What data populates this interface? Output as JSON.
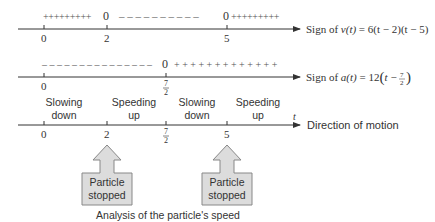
{
  "rows": [
    {
      "signs_left": "+++++++++",
      "zero_a": "0",
      "signs_mid": "– – – – – – – – – –",
      "zero_b": "0",
      "signs_right": "+++++++++",
      "ticks": [
        "0",
        "2",
        "5"
      ],
      "label_prefix": "Sign of ",
      "label_func": "v(t)",
      "label_expr": " = 6(t − 2)(t − 5)"
    },
    {
      "signs_left": "– – – – – – – – – – – – – – –",
      "zero": "0",
      "signs_right": "+ + + + + + + + + + + + +",
      "ticks": [
        "0"
      ],
      "frac_num": "7",
      "frac_den": "2",
      "label_prefix": "Sign of ",
      "label_func": "a(t)",
      "label_expr_a": " = 12",
      "label_expr_b": "t − ",
      "label_frac_num": "7",
      "label_frac_den": "2"
    },
    {
      "intervals": [
        {
          "line1": "Slowing",
          "line2": "down"
        },
        {
          "line1": "Speeding",
          "line2": "up"
        },
        {
          "line1": "Slowing",
          "line2": "down"
        },
        {
          "line1": "Speeding",
          "line2": "up"
        }
      ],
      "ticks": [
        "0",
        "2",
        "5"
      ],
      "frac_num": "7",
      "frac_den": "2",
      "axis_var": "t",
      "label": "Direction of motion"
    }
  ],
  "callouts": [
    {
      "line1": "Particle",
      "line2": "stopped",
      "at": "2"
    },
    {
      "line1": "Particle",
      "line2": "stopped",
      "at": "5"
    }
  ],
  "caption": "Analysis of the particle's speed",
  "colors": {
    "axis": "#333333",
    "arrow_fill": "#dcdcdc",
    "arrow_stroke": "#888888"
  }
}
